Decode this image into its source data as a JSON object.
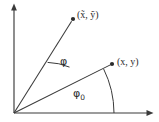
{
  "figure": {
    "background_color": "#ffffff",
    "stroke_color": "#3a3a3a",
    "text_color": "#2b2b2b",
    "width": 159,
    "height": 122
  },
  "axes": {
    "origin": {
      "x": 14,
      "y": 113
    },
    "y_axis": {
      "name": "y-axis",
      "from": {
        "x": 14,
        "y": 113
      },
      "to": {
        "x": 14,
        "y": 5
      },
      "arrow": "up",
      "tick_label": ""
    },
    "x_axis": {
      "name": "x-axis",
      "from": {
        "x": 14,
        "y": 113
      },
      "to": {
        "x": 152,
        "y": 113
      },
      "arrow": "right",
      "tick_label": ""
    }
  },
  "points": [
    {
      "id": "transformed-point",
      "label": "(x̃, ỹ)",
      "dot": {
        "x": 73,
        "y": 19
      },
      "label_position": {
        "x": 77,
        "y": 10
      }
    },
    {
      "id": "original-point",
      "label": "(x, y)",
      "dot": {
        "x": 112,
        "y": 64
      },
      "label_position": {
        "x": 117,
        "y": 57
      }
    }
  ],
  "rays": [
    {
      "id": "ray-to-transformed-point",
      "from": {
        "x": 14,
        "y": 113
      },
      "to": {
        "x": 73,
        "y": 19
      }
    },
    {
      "id": "ray-to-original-point",
      "from": {
        "x": 14,
        "y": 113
      },
      "to": {
        "x": 112,
        "y": 64
      }
    }
  ],
  "angles": [
    {
      "id": "rotation-angle",
      "label": "φ",
      "subscript": "",
      "radius": 62,
      "between": [
        "ray-to-original-point",
        "ray-to-transformed-point"
      ],
      "label_position": {
        "x": 60,
        "y": 56
      }
    },
    {
      "id": "initial-angle",
      "label": "φ",
      "subscript": "0",
      "radius": 100,
      "between": [
        "x-axis",
        "ray-to-original-point"
      ],
      "label_position": {
        "x": 73,
        "y": 88
      }
    }
  ]
}
